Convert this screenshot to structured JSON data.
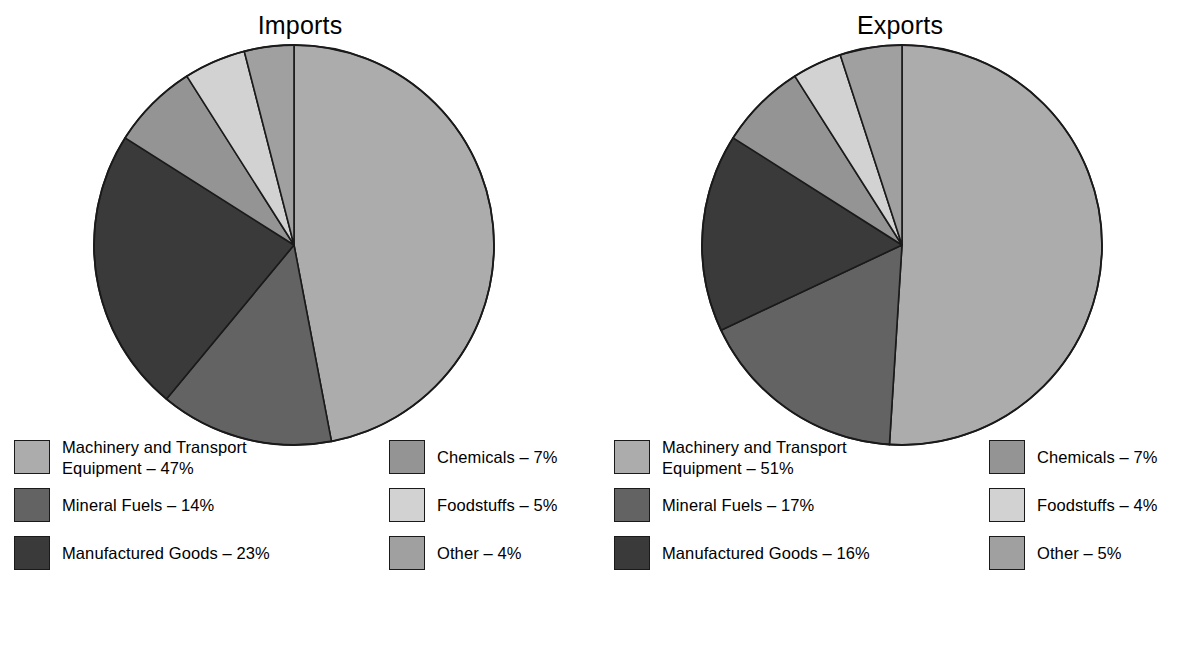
{
  "chart_data": [
    {
      "type": "pie",
      "title": "Imports",
      "categories": [
        "Machinery and Transport Equipment",
        "Mineral Fuels",
        "Manufactured Goods",
        "Chemicals",
        "Foodstuffs",
        "Other"
      ],
      "values": [
        47,
        14,
        23,
        7,
        5,
        4
      ],
      "unit": "%",
      "start_angle_deg": 0,
      "direction": "clockwise",
      "legend_position": "below",
      "colors": [
        "#ACACAC",
        "#636363",
        "#3A3A3A",
        "#949494",
        "#D2D2D2",
        "#A0A0A0"
      ]
    },
    {
      "type": "pie",
      "title": "Exports",
      "categories": [
        "Machinery and Transport Equipment",
        "Mineral Fuels",
        "Manufactured Goods",
        "Chemicals",
        "Foodstuffs",
        "Other"
      ],
      "values": [
        51,
        17,
        16,
        7,
        4,
        5
      ],
      "unit": "%",
      "start_angle_deg": 0,
      "direction": "clockwise",
      "legend_position": "below",
      "colors": [
        "#ACACAC",
        "#636363",
        "#3A3A3A",
        "#949494",
        "#D2D2D2",
        "#A0A0A0"
      ]
    }
  ],
  "colors": {
    "machinery": "#ACACAC",
    "mineral_fuels": "#636363",
    "manufactured_goods": "#3A3A3A",
    "chemicals": "#949494",
    "foodstuffs": "#D2D2D2",
    "other": "#A0A0A0",
    "outline": "#1a1a1a",
    "background": "#FFFFFF"
  },
  "imports": {
    "title": "Imports",
    "legend_col_a": [
      {
        "label": "Machinery and Transport\nEquipment – 47%",
        "color": "#ACACAC"
      },
      {
        "label": "Mineral Fuels – 14%",
        "color": "#636363"
      },
      {
        "label": "Manufactured Goods – 23%",
        "color": "#3A3A3A"
      }
    ],
    "legend_col_b": [
      {
        "label": "Chemicals – 7%",
        "color": "#949494"
      },
      {
        "label": "Foodstuffs – 5%",
        "color": "#D2D2D2"
      },
      {
        "label": "Other – 4%",
        "color": "#A0A0A0"
      }
    ]
  },
  "exports": {
    "title": "Exports",
    "legend_col_a": [
      {
        "label": "Machinery and Transport\nEquipment – 51%",
        "color": "#ACACAC"
      },
      {
        "label": "Mineral Fuels – 17%",
        "color": "#636363"
      },
      {
        "label": "Manufactured Goods – 16%",
        "color": "#3A3A3A"
      }
    ],
    "legend_col_b": [
      {
        "label": "Chemicals – 7%",
        "color": "#949494"
      },
      {
        "label": "Foodstuffs – 4%",
        "color": "#D2D2D2"
      },
      {
        "label": "Other – 5%",
        "color": "#A0A0A0"
      }
    ]
  }
}
